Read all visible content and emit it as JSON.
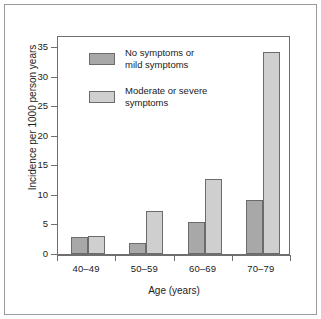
{
  "chart_data": {
    "type": "bar",
    "title": "",
    "xlabel": "Age (years)",
    "ylabel": "Incidence per 1000 person years",
    "categories": [
      "40–49",
      "50–59",
      "60–69",
      "70–79"
    ],
    "series": [
      {
        "name": "No symptoms or mild symptoms",
        "color": "#a8a8a8",
        "values": [
          2.8,
          1.8,
          5.4,
          9.2
        ]
      },
      {
        "name": "Moderate or severe symptoms",
        "color": "#cfcfcf",
        "values": [
          3.1,
          7.2,
          12.6,
          34.2
        ]
      }
    ],
    "ylim": [
      0,
      37
    ],
    "yticks": [
      0,
      5,
      10,
      15,
      20,
      25,
      30,
      35
    ],
    "ytick_labels": [
      "0",
      "5",
      "10",
      "15",
      "20",
      "25",
      "30",
      "35"
    ],
    "grid": false,
    "legend_position": "upper-left-inside"
  },
  "legend": {
    "items": [
      {
        "label": "No symptoms or\nmild symptoms",
        "swatch": "dark"
      },
      {
        "label": "Moderate or severe\nsymptoms",
        "swatch": "light"
      }
    ]
  },
  "colors": {
    "series_dark": "#a8a8a8",
    "series_light": "#cfcfcf",
    "bar_border": "#6b6b6b",
    "axis": "#6f6f6f",
    "frame": "#9a9a9a",
    "text": "#1b1b1b",
    "background": "#ffffff"
  }
}
